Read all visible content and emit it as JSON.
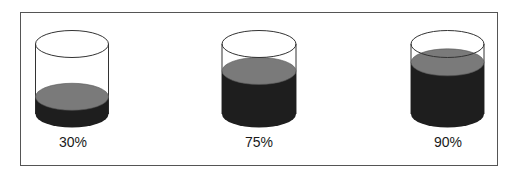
{
  "colors": {
    "frame": "#555555",
    "outline": "#333333",
    "liquid_top": "#7a7a7a",
    "liquid_body": "#1e1e1e",
    "background": "#ffffff"
  },
  "cylinders": [
    {
      "label": "30%",
      "fill_percent": 30,
      "cx": 72,
      "rx": 36.5
    },
    {
      "label": "75%",
      "fill_percent": 75,
      "cx": 259,
      "rx": 37
    },
    {
      "label": "90%",
      "fill_percent": 90,
      "cx": 447.5,
      "rx": 36.5
    }
  ],
  "chart_data": {
    "type": "bar",
    "title": "",
    "categories": [
      "Cylinder 1",
      "Cylinder 2",
      "Cylinder 3"
    ],
    "values": [
      30,
      75,
      90
    ],
    "labels": [
      "30%",
      "75%",
      "90%"
    ],
    "ylim": [
      0,
      100
    ],
    "xlabel": "",
    "ylabel": ""
  }
}
